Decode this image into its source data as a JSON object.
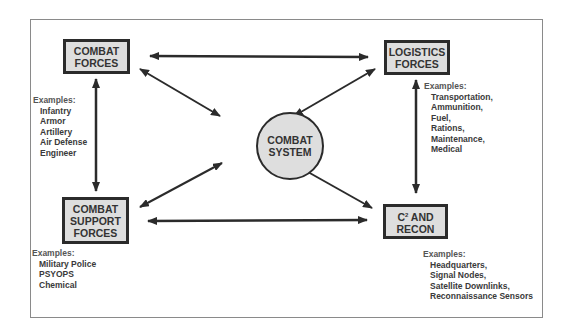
{
  "diagram": {
    "center": {
      "line1": "COMBAT",
      "line2": "SYSTEM"
    },
    "nodes": {
      "combat_forces": {
        "line1": "COMBAT",
        "line2": "FORCES"
      },
      "logistics_forces": {
        "line1": "LOGISTICS",
        "line2": "FORCES"
      },
      "combat_support_forces": {
        "line1": "COMBAT",
        "line2": "SUPPORT",
        "line3": "FORCES"
      },
      "c2_recon": {
        "line1_prefix": "C",
        "line1_sup": "2",
        "line1_suffix": " AND",
        "line2": "RECON"
      }
    },
    "examples": {
      "combat_forces": {
        "header": "Examples:",
        "items": [
          "Infantry",
          "Armor",
          "Artillery",
          "Air Defense",
          "Engineer"
        ]
      },
      "logistics_forces": {
        "header": "Examples:",
        "items": [
          "Transportation,",
          "Ammunition,",
          "Fuel,",
          "Rations,",
          "Maintenance,",
          "Medical"
        ]
      },
      "combat_support_forces": {
        "header": "Examples:",
        "items": [
          "Military Police",
          "PSYOPS",
          "Chemical"
        ]
      },
      "c2_recon": {
        "header": "Examples:",
        "items": [
          "Headquarters,",
          "Signal Nodes,",
          "Satellite Downlinks,",
          "Reconnaissance Sensors"
        ]
      }
    },
    "connections": [
      {
        "from": "combat_forces",
        "to": "logistics_forces",
        "type": "bidirectional"
      },
      {
        "from": "combat_forces",
        "to": "combat_support_forces",
        "type": "bidirectional"
      },
      {
        "from": "logistics_forces",
        "to": "c2_recon",
        "type": "bidirectional"
      },
      {
        "from": "combat_support_forces",
        "to": "c2_recon",
        "type": "bidirectional"
      },
      {
        "from": "combat_forces",
        "to": "center",
        "type": "bidirectional"
      },
      {
        "from": "logistics_forces",
        "to": "center",
        "type": "bidirectional"
      },
      {
        "from": "combat_support_forces",
        "to": "center",
        "type": "bidirectional"
      },
      {
        "from": "c2_recon",
        "to": "center",
        "type": "bidirectional"
      }
    ],
    "colors": {
      "box_fill": "#dedede",
      "stroke": "#2b2b2b",
      "text": "#333333"
    }
  }
}
